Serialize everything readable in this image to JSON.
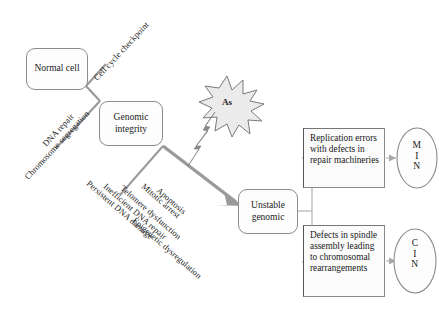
{
  "diagram": {
    "colors": {
      "background": "#ffffff",
      "node_border": "#8c8c8c",
      "connector": "#9a9a9a",
      "arrow_gray": "#8f8f8f",
      "bolt_gray": "#7f7f7f",
      "starburst_fill": "#ebebeb",
      "text": "#1a1a1a"
    },
    "nodes": {
      "normal_cell": "Normal cell",
      "genomic_integrity": "Genomic integrity",
      "unstable_genomic": "Unstable genomic",
      "replication_errors": "Replication errors with defects in repair machineries",
      "spindle_defects": "Defects in spindle assembly leading to chromosomal rearrangements"
    },
    "stressor": {
      "label": "As",
      "shape": "starburst",
      "icon": "lightning-bolt"
    },
    "outcomes": [
      {
        "id": "min",
        "letters": [
          "M",
          "I",
          "N"
        ],
        "full": "MIN"
      },
      {
        "id": "cin",
        "letters": [
          "C",
          "I",
          "N"
        ],
        "full": "CIN"
      }
    ],
    "protective_labels": [
      "Cell cycle checkpoint",
      "DNA repair",
      "Chromosome segregation"
    ],
    "damage_labels": [
      "Persistent DNA damage",
      "Inefficient DNA repair",
      "Telomere dysfunction",
      "Mitotic arrest",
      "Apoptosis",
      "Epigenetic dysregulation"
    ]
  }
}
